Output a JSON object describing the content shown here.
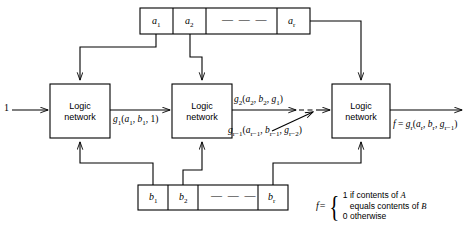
{
  "diagram": {
    "input_label": "1",
    "register_a": {
      "name": "A",
      "cells": [
        "a1",
        "a2",
        "dashes",
        "ar"
      ],
      "cell_labels": [
        {
          "base": "a",
          "sub": "1"
        },
        {
          "base": "a",
          "sub": "2"
        },
        {
          "base": "",
          "sub": "",
          "dashes": "— — —"
        },
        {
          "base": "a",
          "sub": "r"
        }
      ]
    },
    "register_b": {
      "name": "B",
      "cells": [
        "b1",
        "b2",
        "dashes",
        "br"
      ],
      "cell_labels": [
        {
          "base": "b",
          "sub": "1"
        },
        {
          "base": "b",
          "sub": "2"
        },
        {
          "base": "",
          "sub": "",
          "dashes": "— — —"
        },
        {
          "base": "b",
          "sub": "r"
        }
      ]
    },
    "blocks": [
      {
        "line1": "Logic",
        "line2": "network"
      },
      {
        "line1": "Logic",
        "line2": "network"
      },
      {
        "line1": "Logic",
        "line2": "network"
      }
    ],
    "signals": {
      "g1": {
        "fn": "g",
        "sub": "1",
        "args": [
          "a",
          "b",
          "1"
        ],
        "arg_subs": [
          "1",
          "1",
          ""
        ]
      },
      "g2": {
        "fn": "g",
        "sub": "2",
        "args": [
          "a",
          "b",
          "g"
        ],
        "arg_subs": [
          "2",
          "2",
          "1"
        ]
      },
      "gr_1": {
        "fn": "g",
        "sub": "r − 1",
        "args": [
          "a",
          "b",
          "g"
        ],
        "arg_subs": [
          "r − 1",
          "r − 1",
          "r −2"
        ]
      },
      "output": {
        "f": "f",
        "eq": "=",
        "fn": "g",
        "sub": "r",
        "args": [
          "a",
          "b",
          "g"
        ],
        "arg_subs": [
          "r",
          "r",
          "r−1"
        ]
      }
    },
    "legend": {
      "f_symbol": "f",
      "equals": "=",
      "line1": "1 if contents of",
      "line1_var": "A",
      "line2": "equals contents of",
      "line2_var": "B",
      "line3": "0 otherwise"
    }
  }
}
